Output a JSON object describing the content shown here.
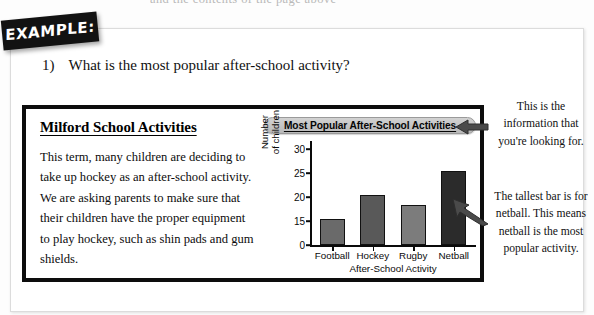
{
  "banner": {
    "label": "EXAMPLE:"
  },
  "cutoff_text": "and the contents of the page above",
  "question": {
    "number": "1)",
    "text": "What is the most popular after-school activity?"
  },
  "article": {
    "title": "Milford School Activities",
    "body": "This term, many children are deciding to take up hockey as an after-school activity.  We are asking parents to make sure that their children have the proper equipment to play hockey, such as shin pads and gum shields."
  },
  "annotations": [
    {
      "id": "annotation-information",
      "text": "This is the information that you're looking for."
    },
    {
      "id": "annotation-tallest-bar",
      "text": "The tallest bar is for netball. This means netball is the most popular activity."
    }
  ],
  "icons": {
    "arrow_1": "arrow-left-icon",
    "arrow_2": "arrow-up-left-icon"
  },
  "chart_data": {
    "type": "bar",
    "title": "Most Popular After-School Activities",
    "xlabel": "After-School Activity",
    "ylabel": "Number of children",
    "ylabel_lines": [
      "Number",
      "of children"
    ],
    "categories": [
      "Football",
      "Hockey",
      "Rugby",
      "Netball"
    ],
    "values": [
      15,
      20,
      18,
      25
    ],
    "yticks": [
      0,
      15,
      20,
      25,
      30
    ],
    "ylim": [
      0,
      30
    ],
    "axis_break": true,
    "grid": false,
    "legend": false,
    "bar_colors": [
      "#6a6a6a",
      "#595959",
      "#7c7c7c",
      "#2b2b2b"
    ]
  }
}
